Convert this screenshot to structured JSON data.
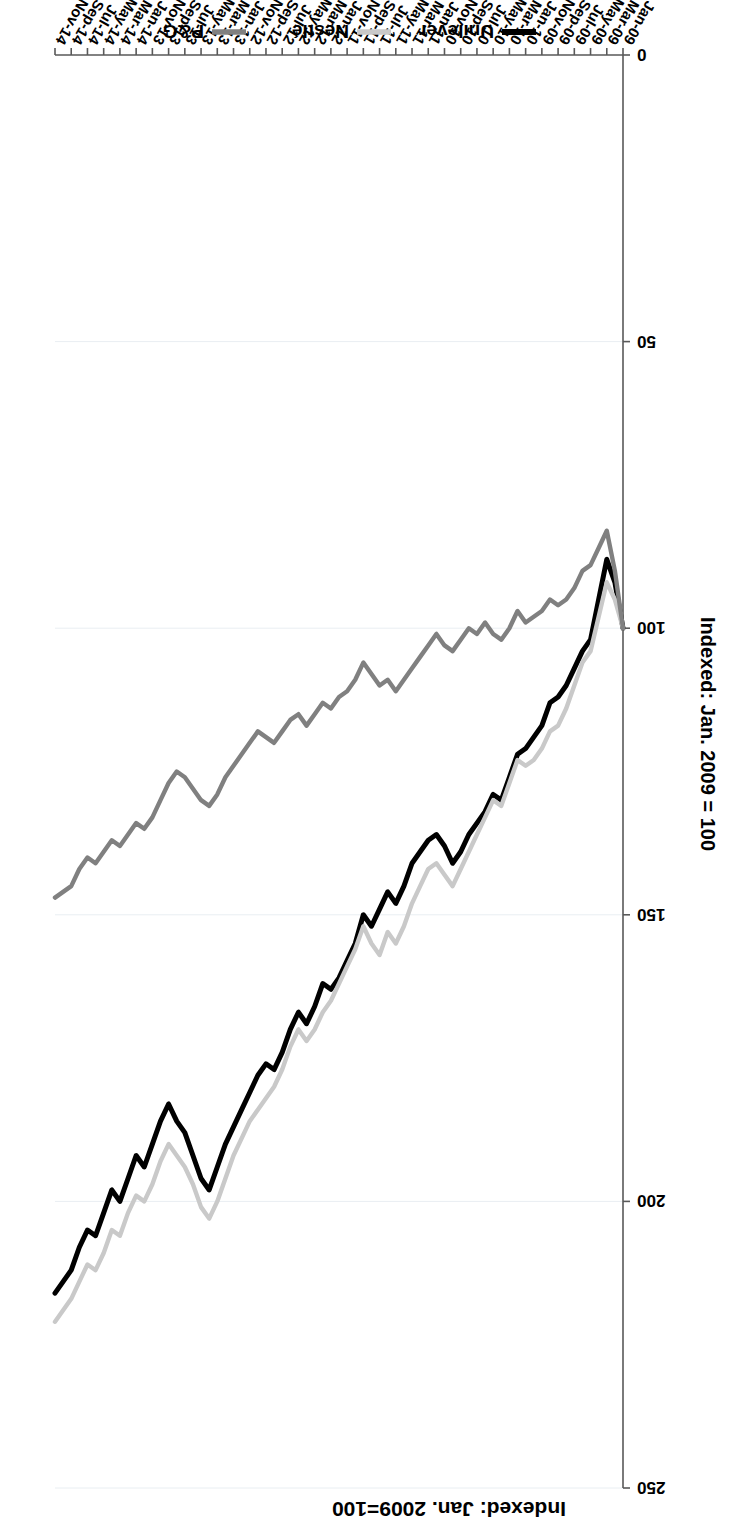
{
  "figure": {
    "title": "Indexed: Jan. 2009=100",
    "y_axis_title": "Indexed: Jan. 2009 = 100",
    "orientation_note": "rotated-180"
  },
  "legend": {
    "position": "bottom",
    "items": [
      {
        "label": "Unilever",
        "color": "#000000",
        "width": 5.0
      },
      {
        "label": "Nestlé",
        "color": "#c9c9c9",
        "width": 4.4
      },
      {
        "label": "P&G",
        "color": "#808080",
        "width": 4.4
      }
    ]
  },
  "axes": {
    "y": {
      "ticks": [
        0,
        50,
        100,
        150,
        200,
        250
      ],
      "min": 0,
      "max": 250,
      "label": "Indexed: Jan. 2009 = 100",
      "grid": true
    },
    "x": {
      "label": "",
      "grid": false,
      "tick_labels": [
        "Jan-09",
        "Mar-09",
        "May-09",
        "Jul-09",
        "Sep-09",
        "Nov-09",
        "Jan-10",
        "Mar-10",
        "May-10",
        "Jul-10",
        "Sep-10",
        "Nov-10",
        "Jan-11",
        "Mar-11",
        "May-11",
        "Jul-11",
        "Sep-11",
        "Nov-11",
        "Jan-12",
        "Mar-12",
        "May-12",
        "Jul-12",
        "Sep-12",
        "Nov-12",
        "Jan-13",
        "Mar-13",
        "May-13",
        "Jul-13",
        "Sep-13",
        "Nov-13",
        "Jan-14",
        "Mar-14",
        "May-14",
        "Jul-14",
        "Sep-14",
        "Nov-14"
      ]
    }
  },
  "chart_data": {
    "type": "line",
    "title": "Indexed: Jan. 2009=100",
    "xlabel": "",
    "ylabel": "Indexed: Jan. 2009 = 100",
    "ylim": [
      0,
      250
    ],
    "grid": true,
    "legend_position": "bottom",
    "categories": [
      "Jan-09",
      "Feb-09",
      "Mar-09",
      "Apr-09",
      "May-09",
      "Jun-09",
      "Jul-09",
      "Aug-09",
      "Sep-09",
      "Oct-09",
      "Nov-09",
      "Dec-09",
      "Jan-10",
      "Feb-10",
      "Mar-10",
      "Apr-10",
      "May-10",
      "Jun-10",
      "Jul-10",
      "Aug-10",
      "Sep-10",
      "Oct-10",
      "Nov-10",
      "Dec-10",
      "Jan-11",
      "Feb-11",
      "Mar-11",
      "Apr-11",
      "May-11",
      "Jun-11",
      "Jul-11",
      "Aug-11",
      "Sep-11",
      "Oct-11",
      "Nov-11",
      "Dec-11",
      "Jan-12",
      "Feb-12",
      "Mar-12",
      "Apr-12",
      "May-12",
      "Jun-12",
      "Jul-12",
      "Aug-12",
      "Sep-12",
      "Oct-12",
      "Nov-12",
      "Dec-12",
      "Jan-13",
      "Feb-13",
      "Mar-13",
      "Apr-13",
      "May-13",
      "Jun-13",
      "Jul-13",
      "Aug-13",
      "Sep-13",
      "Oct-13",
      "Nov-13",
      "Dec-13",
      "Jan-14",
      "Feb-14",
      "Mar-14",
      "Apr-14",
      "May-14",
      "Jun-14",
      "Jul-14",
      "Aug-14",
      "Sep-14",
      "Oct-14",
      "Nov-14"
    ],
    "series": [
      {
        "name": "Unilever",
        "color": "#000000",
        "values": [
          100,
          92,
          88,
          95,
          102,
          104,
          107,
          110,
          112,
          113,
          117,
          119,
          121,
          122,
          126,
          130,
          129,
          132,
          134,
          136,
          139,
          141,
          138,
          136,
          137,
          139,
          141,
          145,
          148,
          146,
          149,
          152,
          150,
          155,
          158,
          161,
          163,
          162,
          166,
          169,
          167,
          170,
          174,
          177,
          176,
          178,
          181,
          184,
          187,
          190,
          194,
          198,
          196,
          192,
          188,
          186,
          183,
          186,
          190,
          194,
          192,
          196,
          200,
          198,
          202,
          206,
          205,
          208,
          212,
          214,
          216
        ]
      },
      {
        "name": "Nestlé",
        "color": "#c9c9c9",
        "values": [
          100,
          95,
          92,
          98,
          104,
          106,
          110,
          114,
          117,
          118,
          121,
          123,
          124,
          123,
          127,
          131,
          130,
          133,
          136,
          139,
          142,
          145,
          143,
          141,
          142,
          145,
          148,
          152,
          155,
          153,
          157,
          155,
          152,
          156,
          159,
          162,
          165,
          167,
          170,
          172,
          170,
          173,
          177,
          180,
          182,
          184,
          186,
          189,
          192,
          196,
          200,
          203,
          201,
          197,
          194,
          192,
          190,
          193,
          197,
          200,
          199,
          202,
          206,
          205,
          209,
          212,
          211,
          214,
          217,
          219,
          221
        ]
      },
      {
        "name": "P&G",
        "color": "#808080",
        "values": [
          100,
          90,
          83,
          86,
          89,
          90,
          93,
          95,
          96,
          95,
          97,
          98,
          99,
          97,
          100,
          102,
          101,
          99,
          101,
          100,
          102,
          104,
          103,
          101,
          103,
          105,
          107,
          109,
          111,
          109,
          110,
          108,
          106,
          109,
          111,
          112,
          114,
          113,
          115,
          117,
          115,
          116,
          118,
          120,
          119,
          118,
          120,
          122,
          124,
          126,
          129,
          131,
          130,
          128,
          126,
          125,
          127,
          130,
          133,
          135,
          134,
          136,
          138,
          137,
          139,
          141,
          140,
          142,
          145,
          146,
          147
        ]
      }
    ]
  }
}
